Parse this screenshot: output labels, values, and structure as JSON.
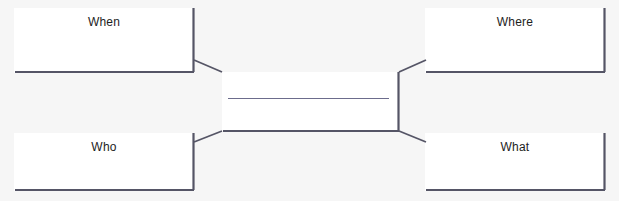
{
  "diagram": {
    "type": "five-w-concept-map",
    "background_color": "#f6f6f6",
    "box_fill_color": "#ffffff",
    "border_color": "#555566",
    "text_color": "#1d1d1d",
    "center": {
      "label": "",
      "has_blank_line": true,
      "line_color": "#6c6c8c"
    },
    "nodes": [
      {
        "id": "when",
        "label": "When",
        "position": "top-left"
      },
      {
        "id": "where",
        "label": "Where",
        "position": "top-right"
      },
      {
        "id": "who",
        "label": "Who",
        "position": "bottom-left"
      },
      {
        "id": "what",
        "label": "What",
        "position": "bottom-right"
      }
    ],
    "connectors": [
      {
        "from": "when",
        "to": "center"
      },
      {
        "from": "where",
        "to": "center"
      },
      {
        "from": "who",
        "to": "center"
      },
      {
        "from": "what",
        "to": "center"
      }
    ]
  }
}
